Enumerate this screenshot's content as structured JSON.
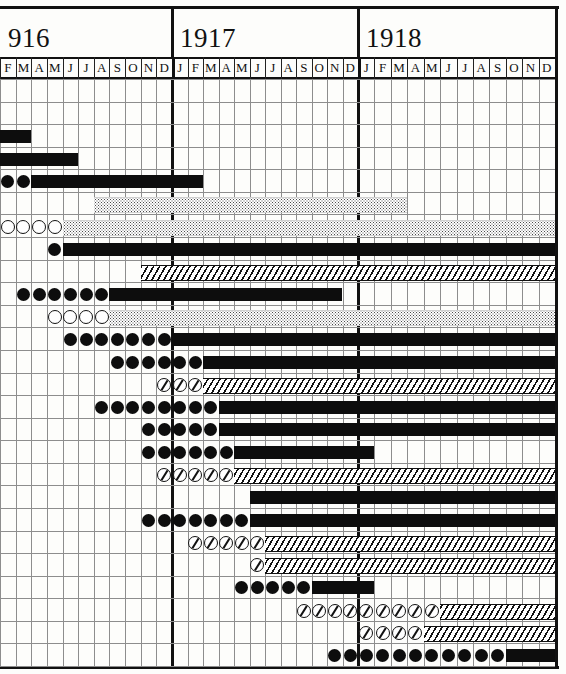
{
  "figure": {
    "kind": "historical-gantt-schedule-chart",
    "note_visible_text": "none"
  },
  "axis": {
    "years": [
      {
        "label": "916",
        "x": 0,
        "w": 172,
        "months": [
          "F",
          "M",
          "A",
          "M",
          "J",
          "J",
          "A",
          "S",
          "O",
          "N",
          "D"
        ]
      },
      {
        "label": "1917",
        "x": 172,
        "w": 186,
        "months": [
          "J",
          "F",
          "M",
          "A",
          "M",
          "J",
          "J",
          "A",
          "S",
          "O",
          "N",
          "D"
        ]
      },
      {
        "label": "1918",
        "x": 358,
        "w": 197,
        "months": [
          "J",
          "F",
          "M",
          "A",
          "M",
          "J",
          "J",
          "A",
          "S",
          "O",
          "N",
          "D"
        ]
      }
    ],
    "total_columns": 35,
    "grid": true
  },
  "legend_symbols": {
    "solid-bar": "solid black bar",
    "stipple-bar": "stippled / dotted bar",
    "hatch-bar": "diagonally hatched bar",
    "filled-circle": "filled circle marker",
    "open-circle": "open circle marker",
    "hatched-circle": "slashed circle marker"
  },
  "colors": {
    "ink": "#0d0d0d",
    "grid": "#8d8d8d",
    "paper": "#fdfdfb"
  },
  "chart_data": {
    "type": "bar",
    "title": "",
    "xlabel": "",
    "ylabel": "",
    "categories": [
      "916-F",
      "916-M",
      "916-A",
      "916-M",
      "916-J",
      "916-J",
      "916-A",
      "916-S",
      "916-O",
      "916-N",
      "916-D",
      "1917-J",
      "1917-F",
      "1917-M",
      "1917-A",
      "1917-M",
      "1917-J",
      "1917-J",
      "1917-A",
      "1917-S",
      "1917-O",
      "1917-N",
      "1917-D",
      "1918-J",
      "1918-F",
      "1918-M",
      "1918-A",
      "1918-M",
      "1918-J",
      "1918-J",
      "1918-A",
      "1918-S",
      "1918-O",
      "1918-N",
      "1918-D"
    ],
    "row_count": 26,
    "rows": [
      {
        "i": 0,
        "markers": [],
        "marker_style": "",
        "bar": null
      },
      {
        "i": 1,
        "markers": [],
        "marker_style": "",
        "bar": null
      },
      {
        "i": 2,
        "markers": [],
        "marker_style": "",
        "bar": {
          "style": "solid",
          "start": 0,
          "end": 2
        }
      },
      {
        "i": 3,
        "markers": [],
        "marker_style": "",
        "bar": {
          "style": "solid",
          "start": 0,
          "end": 5
        }
      },
      {
        "i": 4,
        "markers": [
          0,
          1
        ],
        "marker_style": "filled",
        "bar": {
          "style": "solid",
          "start": 2,
          "end": 13
        }
      },
      {
        "i": 5,
        "markers": [],
        "marker_style": "",
        "bar": {
          "style": "stipple",
          "start": 6,
          "end": 26
        }
      },
      {
        "i": 6,
        "markers": [
          0,
          1,
          2,
          3
        ],
        "marker_style": "open",
        "bar": {
          "style": "stipple",
          "start": 4,
          "end": 35
        }
      },
      {
        "i": 7,
        "markers": [
          3
        ],
        "marker_style": "filled",
        "bar": {
          "style": "solid",
          "start": 4,
          "end": 35
        }
      },
      {
        "i": 8,
        "markers": [],
        "marker_style": "",
        "bar": {
          "style": "hatch",
          "start": 9,
          "end": 35
        }
      },
      {
        "i": 9,
        "markers": [
          1,
          2,
          3,
          4,
          5,
          6
        ],
        "marker_style": "filled",
        "bar": {
          "style": "solid",
          "start": 7,
          "end": 22
        }
      },
      {
        "i": 10,
        "markers": [
          3,
          4,
          5,
          6
        ],
        "marker_style": "open",
        "bar": {
          "style": "stipple",
          "start": 7,
          "end": 35
        }
      },
      {
        "i": 11,
        "markers": [
          4,
          5,
          6,
          7,
          8,
          9,
          10
        ],
        "marker_style": "filled",
        "bar": {
          "style": "solid",
          "start": 11,
          "end": 35
        }
      },
      {
        "i": 12,
        "markers": [
          7,
          8,
          9,
          10,
          11,
          12
        ],
        "marker_style": "filled",
        "bar": {
          "style": "solid",
          "start": 13,
          "end": 35
        }
      },
      {
        "i": 13,
        "markers": [
          10,
          11,
          12
        ],
        "marker_style": "hatched",
        "bar": {
          "style": "hatch",
          "start": 13,
          "end": 35
        }
      },
      {
        "i": 14,
        "markers": [
          6,
          7,
          8,
          9,
          10,
          11,
          12,
          13
        ],
        "marker_style": "filled",
        "bar": {
          "style": "solid",
          "start": 14,
          "end": 35
        }
      },
      {
        "i": 15,
        "markers": [
          9,
          10,
          11,
          12,
          13
        ],
        "marker_style": "filled",
        "bar": {
          "style": "solid",
          "start": 14,
          "end": 35
        }
      },
      {
        "i": 16,
        "markers": [
          9,
          10,
          11,
          12,
          13,
          14
        ],
        "marker_style": "filled",
        "bar": {
          "style": "solid",
          "start": 15,
          "end": 24
        }
      },
      {
        "i": 17,
        "markers": [
          10,
          11,
          12,
          13,
          14
        ],
        "marker_style": "hatched",
        "bar": {
          "style": "hatch",
          "start": 15,
          "end": 35
        }
      },
      {
        "i": 18,
        "markers": [],
        "marker_style": "",
        "bar": {
          "style": "solid",
          "start": 16,
          "end": 35
        }
      },
      {
        "i": 19,
        "markers": [
          9,
          10,
          11,
          12,
          13,
          14,
          15
        ],
        "marker_style": "filled",
        "bar": {
          "style": "solid",
          "start": 16,
          "end": 35
        }
      },
      {
        "i": 20,
        "markers": [
          12,
          13,
          14,
          15,
          16
        ],
        "marker_style": "hatched",
        "bar": {
          "style": "hatch",
          "start": 17,
          "end": 35
        }
      },
      {
        "i": 21,
        "markers": [
          16
        ],
        "marker_style": "hatched",
        "bar": {
          "style": "hatch",
          "start": 17,
          "end": 35
        }
      },
      {
        "i": 22,
        "markers": [
          15,
          16,
          17,
          18,
          19
        ],
        "marker_style": "filled",
        "bar": {
          "style": "solid",
          "start": 20,
          "end": 24
        }
      },
      {
        "i": 23,
        "markers": [
          19,
          20,
          21,
          22,
          23,
          24,
          25,
          26,
          27
        ],
        "marker_style": "hatched",
        "bar": {
          "style": "hatch",
          "start": 28,
          "end": 35
        }
      },
      {
        "i": 24,
        "markers": [
          23,
          24,
          25,
          26
        ],
        "marker_style": "hatched",
        "bar": {
          "style": "hatch",
          "start": 27,
          "end": 35
        }
      },
      {
        "i": 25,
        "markers": [
          21,
          22,
          23,
          24,
          25,
          26,
          27,
          28,
          29,
          30,
          31
        ],
        "marker_style": "filled",
        "bar": {
          "style": "solid",
          "start": 32,
          "end": 35
        }
      }
    ]
  }
}
